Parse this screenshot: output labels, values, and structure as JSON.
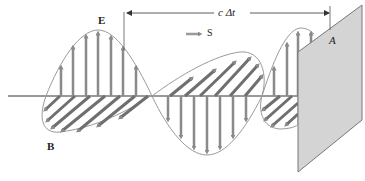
{
  "diagram": {
    "labels": {
      "electric_field": "E",
      "magnetic_field": "B",
      "poynting": "S",
      "distance": "c Δt",
      "area": "A"
    },
    "colors": {
      "arrow": "#8a8a8a",
      "envelope": "#9a9a9a",
      "axis": "#333333",
      "plate_fill": "#d4d4d4",
      "plate_edge": "#777777",
      "text": "#222222"
    }
  }
}
